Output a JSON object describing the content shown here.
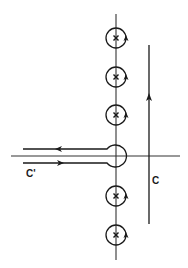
{
  "diagram": {
    "title": "",
    "colors": {
      "ink": "#1a1a1a",
      "background": "#ffffff"
    },
    "axes": {
      "imaginary_axis": {
        "x": 116,
        "y_start": 14,
        "y_end": 260
      },
      "real_axis": {
        "y": 156,
        "x_start": 11,
        "x_end": 180
      }
    },
    "poles": [
      {
        "id": "pole-1",
        "cx": 116,
        "cy": 38,
        "r": 10,
        "marker": "x",
        "orientation": "counterclockwise"
      },
      {
        "id": "pole-2",
        "cx": 116,
        "cy": 77,
        "r": 10,
        "marker": "x",
        "orientation": "counterclockwise"
      },
      {
        "id": "pole-3",
        "cx": 116,
        "cy": 115,
        "r": 10,
        "marker": "x",
        "orientation": "counterclockwise"
      },
      {
        "id": "pole-4",
        "cx": 116,
        "cy": 196,
        "r": 10,
        "marker": "x",
        "orientation": "counterclockwise"
      },
      {
        "id": "pole-5",
        "cx": 116,
        "cy": 235,
        "r": 10,
        "marker": "x",
        "orientation": "counterclockwise"
      }
    ],
    "keyhole_contour": {
      "label": "C'",
      "circle": {
        "cx": 116,
        "cy": 156,
        "r": 11
      },
      "upper_line": {
        "y": 149,
        "x_start": 23,
        "direction": "left"
      },
      "lower_line": {
        "y": 163,
        "x_start": 23,
        "direction": "right"
      },
      "label_pos": {
        "x": 26,
        "y": 177
      }
    },
    "vertical_contour": {
      "label": "C",
      "x": 149,
      "y_start": 45,
      "y_end": 224,
      "direction": "up",
      "arrow_y": 98,
      "label_pos": {
        "x": 152,
        "y": 184
      }
    }
  }
}
